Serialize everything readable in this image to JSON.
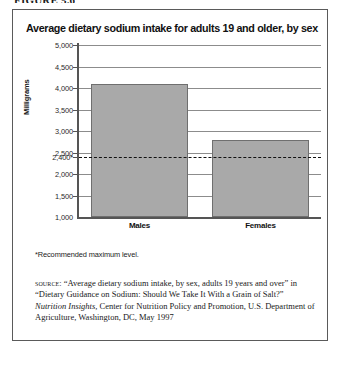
{
  "figure_caption": "FIGURE 5.6",
  "panel": {
    "title": "Average dietary sodium intake for adults 19 and older, by sex",
    "footnote": "*Recommended maximum level.",
    "source": {
      "label": "source:",
      "part1": " “Average dietary sodium intake, by sex, adults 19 years and over” in “Dietary Guidance on Sodium: Should We Take It With a Grain of Salt?” ",
      "italic": "Nutrition Insights,",
      "part2": " Center for Nutrition Policy and Promotion, U.S. Department of Agriculture, Washington, DC, May 1997"
    }
  },
  "chart_data": {
    "type": "bar",
    "title": "Average dietary sodium intake for adults 19 and older, by sex",
    "xlabel": "",
    "ylabel": "Milligrams",
    "categories": [
      "Males",
      "Females"
    ],
    "values": [
      4100,
      2800
    ],
    "ylim": [
      1000,
      5000
    ],
    "yticks": [
      1000,
      1500,
      2000,
      2500,
      3000,
      3500,
      4000,
      4500,
      5000
    ],
    "ytick_labels": [
      "1,000",
      "1,500",
      "2,000",
      "2,500",
      "3,000",
      "3,500",
      "4,000",
      "4,500",
      "5,000"
    ],
    "grid": true,
    "legend": "none",
    "reference_line": {
      "value": 2400,
      "label": "2,400*",
      "style": "dashed",
      "note": "Recommended maximum level"
    },
    "bar_color": "#a9a9a9",
    "bar_edge_color": "#6f6f6f"
  }
}
